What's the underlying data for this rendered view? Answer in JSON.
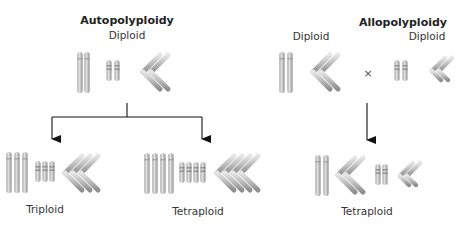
{
  "diagram": {
    "type": "polyploidy-comparison",
    "panels": [
      {
        "id": "autopolyploidy",
        "title": "Autopolyploidy",
        "parent": {
          "label": "Diploid",
          "chromosome_sets": 2,
          "chromosome_types": [
            "long-metacentric",
            "short-banded",
            "V-shaped"
          ]
        },
        "offspring": [
          {
            "label": "Triploid",
            "chromosome_sets": 3
          },
          {
            "label": "Tetraploid",
            "chromosome_sets": 4
          }
        ]
      },
      {
        "id": "allopolyploidy",
        "title": "Allopolyploidy",
        "parents": [
          {
            "label": "Diploid",
            "chromosome_types": [
              "long-metacentric",
              "V-shaped-large"
            ]
          },
          {
            "label": "Diploid",
            "chromosome_types": [
              "short-banded",
              "V-shaped-small"
            ]
          }
        ],
        "cross_symbol": "×",
        "offspring": [
          {
            "label": "Tetraploid",
            "chromosome_sets": 4
          }
        ]
      }
    ],
    "colors": {
      "chromosome_fill": "#bdbdbd",
      "chromosome_highlight": "#e6e6e6",
      "chromosome_shadow": "#8a8a8a",
      "arrow": "#111111",
      "text": "#222222"
    }
  },
  "labels": {
    "auto_title": "Autopolyploidy",
    "auto_parent": "Diploid",
    "auto_child1": "Triploid",
    "auto_child2": "Tetraploid",
    "allo_title": "Allopolyploidy",
    "allo_parent1": "Diploid",
    "allo_parent2": "Diploid",
    "allo_cross": "×",
    "allo_child": "Tetraploid"
  }
}
